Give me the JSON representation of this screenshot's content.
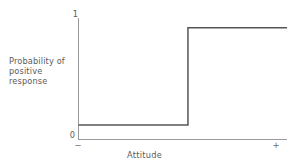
{
  "chart_data": {
    "type": "line",
    "subtype": "step",
    "title": "",
    "xlabel": "Attitude",
    "ylabel": "Probability of\npositive response",
    "ylabel_lines": [
      "Probability of",
      "positive response"
    ],
    "x_tick_labels": [
      "−",
      "+"
    ],
    "y_tick_labels": [
      "0",
      "1"
    ],
    "xlim": [
      0,
      1
    ],
    "ylim": [
      0,
      1
    ],
    "grid": false,
    "legend": false,
    "series": [
      {
        "name": "deterministic response function",
        "step": "post",
        "x": [
          0.0,
          0.525,
          0.525,
          1.0
        ],
        "y": [
          0.12,
          0.12,
          0.92,
          0.92
        ],
        "color": "#555555",
        "line_width": 1.5
      }
    ],
    "annotations": {
      "threshold_x": 0.525,
      "low_plateau_y": 0.12,
      "high_plateau_y": 0.92
    },
    "axis_color": "#9a9a9a",
    "text_color": "#5a5a5a"
  },
  "axes": {
    "y_top_label": "1",
    "y_bottom_label": "0",
    "x_left_label": "−",
    "x_right_label": "+",
    "x_title": "Attitude",
    "y_title": "Probability of\npositive response"
  }
}
